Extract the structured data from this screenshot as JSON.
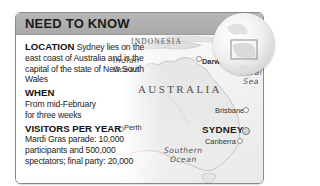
{
  "header": {
    "title": "NEED TO KNOW"
  },
  "info": {
    "location": {
      "heading": "LOCATION",
      "text": "Sydney lies on the east coast of Australia and is the capital of the state of New South Wales"
    },
    "when": {
      "heading": "WHEN",
      "text": "From mid-February for three weeks"
    },
    "visitors": {
      "heading": "VISITORS PER YEAR",
      "text": "Mardi Gras parade: 10,000 participants and 500,000 spectators; final party: 20,000"
    }
  },
  "map": {
    "country_label": "AUSTRALIA",
    "neighbor_label": "INDONESIA",
    "oceans": [
      {
        "line1": "Indian",
        "line2": "Ocean"
      },
      {
        "line1": "Coral",
        "line2": "Sea"
      },
      {
        "line1": "Southern",
        "line2": "Ocean"
      }
    ],
    "cities": [
      {
        "name": "Darwin"
      },
      {
        "name": "Perth"
      },
      {
        "name": "Brisbane"
      },
      {
        "name": "Canberra"
      }
    ],
    "highlight_city": "SYDNEY"
  },
  "colors": {
    "header_bg": "#adadad",
    "border": "#8a8a8a",
    "text": "#222222"
  }
}
